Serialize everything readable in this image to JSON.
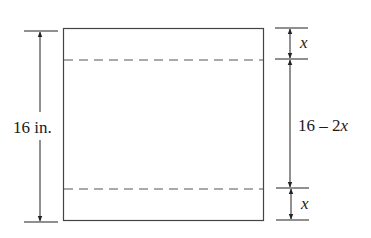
{
  "diagram": {
    "type": "dimensioned-rectangle",
    "left_dimension": {
      "label": "16 in."
    },
    "right_dimensions": {
      "top": {
        "label": "x"
      },
      "middle": {
        "label_prefix": "16 – 2",
        "label_var": "x"
      },
      "bottom": {
        "label": "x"
      }
    },
    "fold_lines": {
      "style": "dashed",
      "count": 2
    },
    "colors": {
      "stroke": "#333333",
      "dashed": "#555555",
      "background": "#ffffff"
    }
  }
}
